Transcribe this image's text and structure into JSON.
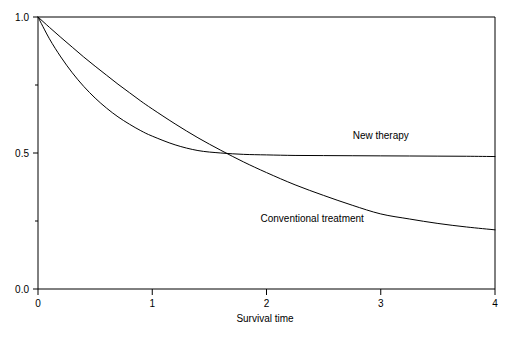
{
  "chart_data": {
    "type": "line",
    "title": "",
    "subtitle": "",
    "xlabel": "Survival time",
    "ylabel": "",
    "xlim": [
      0,
      4
    ],
    "ylim": [
      0,
      1.0
    ],
    "grid": false,
    "legend_position": "inline-annotations",
    "xticks": [
      "0",
      "1",
      "2",
      "3",
      "4"
    ],
    "xtick_values": [
      0,
      1,
      2,
      3,
      4
    ],
    "yticks": [
      "1.0",
      "0.5",
      "0.0"
    ],
    "ytick_values": [
      1.0,
      0.5,
      0.0
    ],
    "yminor_ticks": [
      0.75,
      0.25
    ],
    "annotations": [
      {
        "text": "New therapy",
        "x": 3.0,
        "y": 0.55
      },
      {
        "text": "Conventional treatment",
        "x": 2.4,
        "y": 0.245
      }
    ],
    "series": [
      {
        "name": "New therapy",
        "color": "#000000",
        "x": [
          0.0,
          0.1,
          0.2,
          0.3,
          0.4,
          0.5,
          0.6,
          0.7,
          0.8,
          0.9,
          1.0,
          1.2,
          1.4,
          1.6,
          1.8,
          2.0,
          2.25,
          2.5,
          2.75,
          3.0,
          3.25,
          3.5,
          3.75,
          4.0
        ],
        "values": [
          1.0,
          0.92,
          0.853,
          0.795,
          0.745,
          0.702,
          0.665,
          0.633,
          0.606,
          0.582,
          0.562,
          0.53,
          0.509,
          0.5,
          0.495,
          0.493,
          0.491,
          0.4905,
          0.49,
          0.4895,
          0.489,
          0.4885,
          0.488,
          0.487
        ]
      },
      {
        "name": "Conventional treatment",
        "color": "#000000",
        "x": [
          0.0,
          0.1,
          0.2,
          0.3,
          0.4,
          0.5,
          0.6,
          0.7,
          0.8,
          0.9,
          1.0,
          1.2,
          1.4,
          1.6,
          1.8,
          2.0,
          2.25,
          2.5,
          2.75,
          3.0,
          3.25,
          3.5,
          3.75,
          4.0
        ],
        "values": [
          1.0,
          0.962,
          0.925,
          0.889,
          0.853,
          0.819,
          0.786,
          0.753,
          0.722,
          0.691,
          0.662,
          0.607,
          0.556,
          0.51,
          0.467,
          0.428,
          0.383,
          0.344,
          0.308,
          0.276,
          0.2575,
          0.241,
          0.228,
          0.2175
        ]
      }
    ]
  },
  "figure": {
    "background_color": "#ffffff",
    "axis_color": "#000000",
    "curve_color": "#000000"
  }
}
